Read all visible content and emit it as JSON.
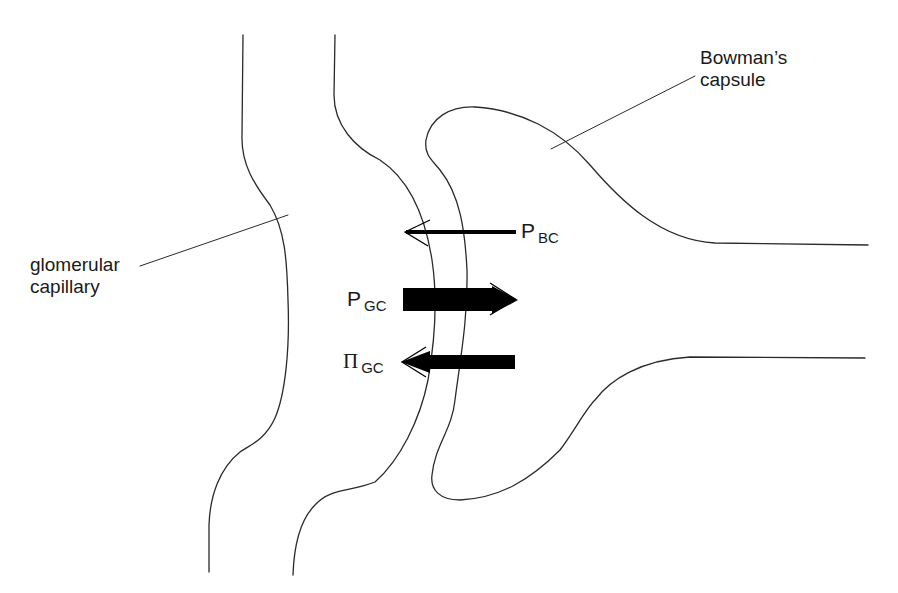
{
  "diagram": {
    "labels": {
      "bowmans_capsule_line1": "Bowman’s",
      "bowmans_capsule_line2": "capsule",
      "glomerular_capillary_line1": "glomerular",
      "glomerular_capillary_line2": "capillary"
    },
    "forces": [
      {
        "symbol": "P",
        "subscript": "BC",
        "direction": "left",
        "weight": "thin"
      },
      {
        "symbol": "P",
        "subscript": "GC",
        "direction": "right",
        "weight": "thick"
      },
      {
        "symbol": "Π",
        "subscript": "GC",
        "direction": "left",
        "weight": "thick"
      }
    ],
    "colors": {
      "stroke": "#2a2a2a",
      "arrow_fill": "#000000",
      "background": "#ffffff"
    }
  }
}
